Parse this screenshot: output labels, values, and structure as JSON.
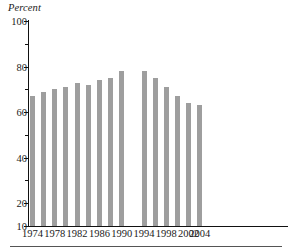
{
  "chart_data": {
    "type": "bar",
    "title": "",
    "subtitle": "",
    "xlabel": "",
    "ylabel": "Percent",
    "ylim": [
      10,
      100
    ],
    "grid": false,
    "legend": null,
    "bar_color": "#9e9e9e",
    "axis_color": "#111111",
    "text_color": "#1a1a1a",
    "note": "Single gap in the series between 1990 and 1994 (no bar plotted for 1992).",
    "y_ticks_major": [
      100,
      80,
      60,
      40,
      20,
      10
    ],
    "y_ticks_minor": [
      90,
      70,
      50,
      30
    ],
    "x_ticks": [
      "1974",
      "1978",
      "1982",
      "1986",
      "1990",
      "1994",
      "1998",
      "2002",
      "2004"
    ],
    "categories": [
      "1974",
      "1976",
      "1978",
      "1980",
      "1982",
      "1984",
      "1986",
      "1988",
      "1990",
      "1994",
      "1996",
      "1998",
      "2000",
      "2002",
      "2004"
    ],
    "values": [
      67,
      69,
      70,
      71,
      73,
      72,
      74,
      75,
      78,
      78,
      75,
      71,
      67,
      64,
      63
    ]
  },
  "bars": [
    {
      "label": "1974",
      "value": 67
    },
    {
      "label": "1976",
      "value": 69
    },
    {
      "label": "1978",
      "value": 70
    },
    {
      "label": "1980",
      "value": 71
    },
    {
      "label": "1982",
      "value": 73
    },
    {
      "label": "1984",
      "value": 72
    },
    {
      "label": "1986",
      "value": 74
    },
    {
      "label": "1988",
      "value": 75
    },
    {
      "label": "1990",
      "value": 78
    },
    {
      "label": "1994",
      "value": 78
    },
    {
      "label": "1996",
      "value": 75
    },
    {
      "label": "1998",
      "value": 71
    },
    {
      "label": "2000",
      "value": 67
    },
    {
      "label": "2002",
      "value": 64
    },
    {
      "label": "2004",
      "value": 63
    }
  ],
  "y_axis": {
    "label": "Percent",
    "ticks": [
      {
        "value": 100,
        "text": "100",
        "major": true
      },
      {
        "value": 90,
        "text": "",
        "major": false
      },
      {
        "value": 80,
        "text": "80",
        "major": true
      },
      {
        "value": 70,
        "text": "",
        "major": false
      },
      {
        "value": 60,
        "text": "60",
        "major": true
      },
      {
        "value": 50,
        "text": "",
        "major": false
      },
      {
        "value": 40,
        "text": "40",
        "major": true
      },
      {
        "value": 30,
        "text": "",
        "major": false
      },
      {
        "value": 20,
        "text": "20",
        "major": true
      },
      {
        "value": 10,
        "text": "10",
        "major": true
      }
    ]
  },
  "x_axis": {
    "ticks": [
      {
        "text": "1974",
        "pos": 0
      },
      {
        "text": "1978",
        "pos": 2
      },
      {
        "text": "1982",
        "pos": 4
      },
      {
        "text": "1986",
        "pos": 6
      },
      {
        "text": "1990",
        "pos": 8
      },
      {
        "text": "1994",
        "pos": 9
      },
      {
        "text": "1998",
        "pos": 11
      },
      {
        "text": "2002",
        "pos": 13
      },
      {
        "text": "2004",
        "pos": 14
      }
    ]
  }
}
